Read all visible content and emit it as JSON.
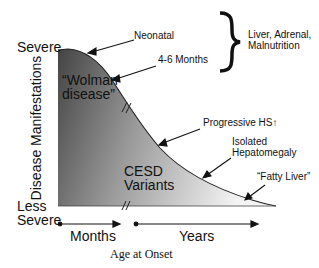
{
  "diagram": {
    "y_axis": {
      "label": "Disease Manifestations",
      "top_label": "Severe",
      "bottom_label_line1": "Less",
      "bottom_label_line2": "Severe"
    },
    "x_axis": {
      "label": "Age at Onset",
      "segments": [
        "Months",
        "Years"
      ]
    },
    "regions": {
      "wolman_line1": "“Wolman",
      "wolman_line2": "disease”",
      "cesd_line1": "CESD",
      "cesd_line2": "Variants"
    },
    "annotations": {
      "neonatal": "Neonatal",
      "four_six_months": "4-6 Months",
      "brace_line1": "Liver, Adrenal,",
      "brace_line2": "Malnutrition",
      "progressive_hs": "Progressive HS",
      "progressive_hs_arrow": "↑",
      "isolated_line1": "Isolated",
      "isolated_line2": "Hepatomegaly",
      "fatty_liver": "“Fatty Liver”"
    },
    "colors": {
      "shade_dark": "#4a4a4a",
      "shade_light": "#f2f2f2",
      "line": "#111111"
    }
  }
}
